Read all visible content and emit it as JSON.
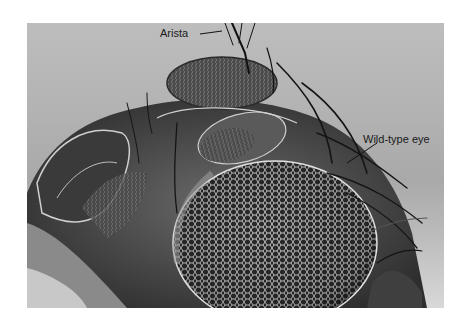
{
  "figure": {
    "labels": {
      "arista": "Arista",
      "wild_type_eye": "Wild-type eye"
    },
    "colors": {
      "background": "#ffffff",
      "photo_bg": "#b5b5b5",
      "label_text": "#1a1a1a"
    }
  }
}
